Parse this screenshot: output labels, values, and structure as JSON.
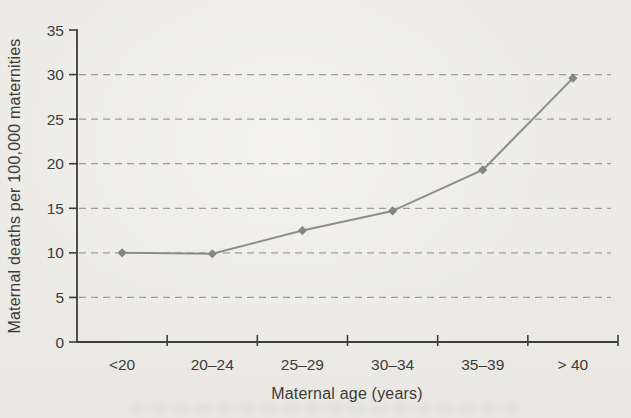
{
  "chart_data": {
    "type": "line",
    "categories": [
      "<20",
      "20–24",
      "25–29",
      "30–34",
      "35–39",
      "> 40"
    ],
    "values": [
      10,
      9.9,
      12.5,
      14.7,
      19.3,
      29.6
    ],
    "series": [
      {
        "name": "Maternal deaths",
        "values": [
          10,
          9.9,
          12.5,
          14.7,
          19.3,
          29.6
        ]
      }
    ],
    "title": "",
    "xlabel": "Maternal age (years)",
    "ylabel": "Maternal deaths per 100,000 maternities",
    "ylim": [
      0,
      35
    ],
    "ytick_step": 5,
    "yticks": [
      0,
      5,
      10,
      15,
      20,
      25,
      30,
      35
    ],
    "grid": "horizontal-dashed",
    "legend_position": "none",
    "marker": "diamond"
  },
  "colors": {
    "background": "#ecebe5",
    "axis": "#3d3d3a",
    "text": "#3d3d3a",
    "gridline": "#9e9e99",
    "line": "#8d8d89",
    "marker": "#858582"
  }
}
